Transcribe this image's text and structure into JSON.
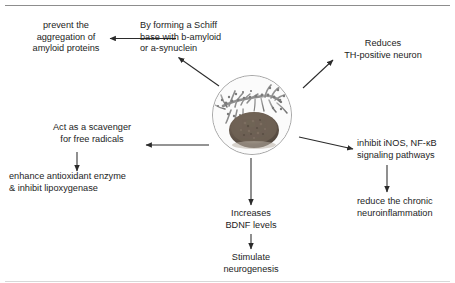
{
  "figure": {
    "type": "concept-diagram",
    "center_node": {
      "name": "herbal-extract-photo",
      "description": "circular photograph of a plant branch with a pile of dark brown powder"
    },
    "branches": [
      {
        "id": "schiff-base",
        "text": "By forming a Schiff\nbase with b-amyloid\nor a-synuclein",
        "x": 140,
        "y": 20,
        "align": "left"
      },
      {
        "id": "prevent-aggregation",
        "text": "prevent the\naggregation of\namyloid proteins",
        "x": 25,
        "y": 20,
        "align": "center"
      },
      {
        "id": "reduces-th-neuron",
        "text": "Reduces\nTH-positive neuron",
        "x": 330,
        "y": 38,
        "align": "center"
      },
      {
        "id": "scavenger",
        "text": "Act as a scavenger\nfor free radicals",
        "x": 43,
        "y": 122,
        "align": "center"
      },
      {
        "id": "antioxidant-enzyme",
        "text": "enhance antioxidant enzyme\n& inhibit lipoxygenase",
        "x": 10,
        "y": 172,
        "align": "left"
      },
      {
        "id": "inhibit-inos",
        "text": "inhibit iNOS, NF-κB\nsignaling pathways",
        "x": 357,
        "y": 138,
        "align": "left"
      },
      {
        "id": "reduce-neuroinflammation",
        "text": "reduce the chronic\nneuroinflammation",
        "x": 357,
        "y": 198,
        "align": "left"
      },
      {
        "id": "increases-bdnf",
        "text": "Increases\nBDNF levels",
        "x": 220,
        "y": 208,
        "align": "center"
      },
      {
        "id": "stimulate-neurogenesis",
        "text": "Stimulate\nneurogenesis",
        "x": 218,
        "y": 252,
        "align": "center"
      }
    ],
    "colors": {
      "text": "#1d1d1d",
      "arrow": "#2b2b2b",
      "rule": "#8d8d8d",
      "circle_border": "#a6a6a6",
      "powder": "#6b5f55",
      "leaf": "#8f8f8f"
    }
  }
}
